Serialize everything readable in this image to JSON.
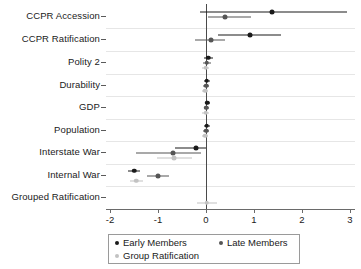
{
  "chart_data": {
    "type": "scatter",
    "title": "",
    "xlabel": "",
    "ylabel": "",
    "xlim": [
      -2.3,
      3.2
    ],
    "ylim_categories": 9,
    "grid": true,
    "legend_position": "bottom",
    "xticks": [
      "-2",
      "-1",
      "0",
      "1",
      "2",
      "3"
    ],
    "xtick_values": [
      -2,
      -1,
      0,
      1,
      2,
      3
    ],
    "categories": [
      "CCPR Accession",
      "CCPR Ratification",
      "Polity 2",
      "Durability",
      "GDP",
      "Population",
      "Interstate War",
      "Internal War",
      "Grouped Ratification"
    ],
    "reference_line": 0,
    "series": [
      {
        "name": "Early Members",
        "color": "#1a1a1a",
        "values": [
          1.38,
          0.92,
          0.05,
          0.02,
          0.03,
          0.02,
          -0.21,
          -1.5,
          null
        ],
        "ci_low": [
          -0.13,
          0.25,
          -0.05,
          -0.04,
          -0.03,
          -0.04,
          -0.65,
          -1.63,
          null
        ],
        "ci_high": [
          2.94,
          1.57,
          0.14,
          0.08,
          0.09,
          0.08,
          0.0,
          -1.37,
          null
        ]
      },
      {
        "name": "Late Members",
        "color": "#555555",
        "values": [
          0.4,
          0.1,
          0.02,
          0.0,
          0.01,
          0.0,
          -0.68,
          -1.0,
          null
        ],
        "ci_low": [
          0.04,
          -0.22,
          -0.07,
          -0.06,
          -0.05,
          -0.06,
          -1.45,
          -1.22,
          null
        ],
        "ci_high": [
          0.93,
          0.4,
          0.1,
          0.06,
          0.07,
          0.06,
          -0.1,
          -0.78,
          null
        ]
      },
      {
        "name": "Group Ratification",
        "color": "#c2c2c2",
        "values": [
          null,
          null,
          -0.01,
          -0.02,
          -0.01,
          -0.02,
          -0.66,
          -1.45,
          0.02
        ],
        "ci_low": [
          null,
          null,
          -0.09,
          -0.09,
          -0.08,
          -0.09,
          -1.02,
          -1.58,
          -0.18
        ],
        "ci_high": [
          null,
          null,
          0.07,
          0.05,
          0.06,
          0.05,
          -0.3,
          -1.32,
          0.22
        ]
      }
    ],
    "legend": [
      {
        "label": "Early Members",
        "color": "#1a1a1a"
      },
      {
        "label": "Late Members",
        "color": "#555555"
      },
      {
        "label": "Group Ratification",
        "color": "#c2c2c2"
      }
    ]
  },
  "axis_colors": {
    "axis": "#6a6a6a",
    "grid": "#e6e6e6",
    "zero": "#4a4a4a",
    "text": "#1a1a1a"
  }
}
